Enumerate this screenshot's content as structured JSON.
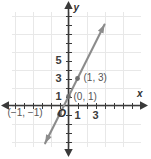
{
  "chart_data": {
    "type": "line",
    "title": "",
    "xlabel": "x",
    "ylabel": "y",
    "xlim": [
      -6,
      9
    ],
    "ylim": [
      -5,
      8
    ],
    "grid": true,
    "grid_step": 2,
    "tick_step": 1,
    "legend": "none",
    "equation": "y = 2x + 1",
    "slope": 2,
    "intercept": 1,
    "x_tick_labels": [
      {
        "value": 1,
        "text": "1"
      },
      {
        "value": 3,
        "text": "3"
      }
    ],
    "y_tick_labels": [
      {
        "value": 1,
        "text": "1"
      },
      {
        "value": 3,
        "text": "3"
      },
      {
        "value": 5,
        "text": "5"
      }
    ],
    "origin_label": "O",
    "series": [
      {
        "name": "y = 2x + 1",
        "color": "#8c8c8c",
        "arrows": "both",
        "x": [
          -2.6,
          4.0
        ],
        "y": [
          -4.2,
          9.0
        ]
      }
    ],
    "points": [
      {
        "x": -1,
        "y": -1,
        "label": "(−1, −1)",
        "label_position": "left"
      },
      {
        "x": 0,
        "y": 1,
        "label": "(0, 1)",
        "label_position": "right"
      },
      {
        "x": 1,
        "y": 3,
        "label": "(1, 3)",
        "label_position": "right"
      }
    ]
  },
  "axes": {
    "x_axis_label": "x",
    "y_axis_label": "y",
    "origin_label": "O"
  },
  "ticks": {
    "x": [
      "1",
      "3"
    ],
    "y": [
      "1",
      "3",
      "5"
    ]
  },
  "annotations": {
    "point_neg1": "(−1, −1)",
    "point_0_1": "(0, 1)",
    "point_1_3": "(1, 3)"
  },
  "colors": {
    "line": "#8c8c8c",
    "axis": "#3a3a3a",
    "grid": "#e6e6e6",
    "text": "#3d3d3d",
    "background": "#ffffff"
  }
}
